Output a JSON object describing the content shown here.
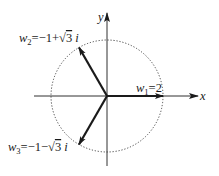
{
  "diagram": {
    "type": "complex-plane-roots",
    "axes": {
      "x_label": "x",
      "y_label": "y"
    },
    "circle": {
      "style": "dotted",
      "radius_value": 2
    },
    "vectors": [
      {
        "name": "w",
        "index": "1",
        "expression": "2",
        "angle_deg": 0,
        "modulus": 2,
        "label_text": "w1=2"
      },
      {
        "name": "w",
        "index": "2",
        "expression": "−1+√3 i",
        "angle_deg": 120,
        "modulus": 2,
        "label_text": "w2=−1+√3 i"
      },
      {
        "name": "w",
        "index": "3",
        "expression": "−1−√3 i",
        "angle_deg": 240,
        "modulus": 2,
        "label_text": "w3=−1−√3 i"
      }
    ],
    "label_parts": {
      "w": "w",
      "eq": "=",
      "w1_index": "1",
      "w1_value": "2",
      "w2_index": "2",
      "w2_real": "−1+",
      "w2_sqrt_arg": "3",
      "w2_imag_unit": "i",
      "w3_index": "3",
      "w3_real": "−1−",
      "w3_sqrt_arg": "3",
      "w3_imag_unit": "i",
      "sqrt_sign": "√"
    },
    "colors": {
      "ink": "#1a1a1a",
      "background": "#ffffff"
    }
  }
}
